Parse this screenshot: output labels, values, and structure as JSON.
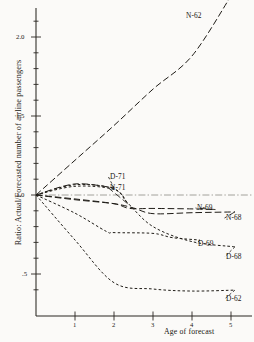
{
  "chart_data": {
    "type": "line",
    "title": "",
    "xlabel": "Age of forecast",
    "ylabel": "Ratio: Actual/Forecasted number of airline passengers",
    "xlim": [
      0,
      5.4
    ],
    "ylim": [
      0.33,
      2.3
    ],
    "xticks": [
      1,
      2,
      3,
      4,
      5
    ],
    "xticklabels": [
      "1",
      "2",
      "3",
      "4",
      "5"
    ],
    "yticks": [
      0.5,
      1.0,
      1.5,
      2.0
    ],
    "yticklabels": [
      ".5",
      "1.0",
      "1.5",
      "2.0"
    ],
    "yminorticks": [
      0.4,
      0.6,
      0.7,
      0.8,
      0.9,
      1.1,
      1.2,
      1.3,
      1.4,
      1.6,
      1.7,
      1.8,
      1.9,
      2.1,
      2.2
    ],
    "grid": false,
    "legend_position": "inline-end-labels",
    "reference_line": {
      "y": 1.0,
      "style": "dash-dot",
      "color": "#8d8b84"
    },
    "series": [
      {
        "name": "N-62",
        "label": "N-62",
        "style": "long-dash",
        "color": "#1f1c17",
        "x": [
          0,
          1,
          2,
          3,
          4,
          5
        ],
        "values": [
          1.0,
          1.22,
          1.44,
          1.67,
          1.88,
          2.26
        ]
      },
      {
        "name": "D-71",
        "label": "D-71",
        "style": "long-dash",
        "color": "#1f1c17",
        "x": [
          0,
          1,
          2
        ],
        "values": [
          1.0,
          1.07,
          1.045
        ]
      },
      {
        "name": "N-71",
        "label": "N-71",
        "style": "short-dash",
        "color": "#1f1c17",
        "x": [
          0,
          1,
          2,
          2.35
        ],
        "values": [
          1.0,
          1.065,
          1.04,
          0.945
        ]
      },
      {
        "name": "N-69",
        "label": "N-69",
        "style": "long-dash",
        "color": "#1f1c17",
        "x": [
          0,
          1,
          2,
          2.4,
          3,
          4,
          4.6
        ],
        "values": [
          1.0,
          0.975,
          0.945,
          0.915,
          0.915,
          0.912,
          0.908
        ]
      },
      {
        "name": "N-68",
        "label": "N-68",
        "style": "long-dash",
        "color": "#1f1c17",
        "x": [
          0,
          1,
          2,
          2.5,
          3,
          4,
          5.1
        ],
        "values": [
          1.0,
          0.97,
          0.945,
          0.918,
          0.882,
          0.888,
          0.893
        ]
      },
      {
        "name": "D-69",
        "label": "D-69",
        "style": "short-dash",
        "color": "#1f1c17",
        "x": [
          0,
          1,
          1.8,
          2,
          3,
          3.5,
          4.2
        ],
        "values": [
          1.0,
          0.885,
          0.77,
          0.762,
          0.757,
          0.73,
          0.715
        ]
      },
      {
        "name": "D-68",
        "label": "D-68",
        "style": "short-dash",
        "color": "#1f1c17",
        "x": [
          0,
          1,
          2,
          2.35,
          3,
          4,
          5.1
        ],
        "values": [
          1.0,
          1.055,
          1.035,
          0.95,
          0.8,
          0.705,
          0.672
        ]
      },
      {
        "name": "D-62",
        "label": "D-62",
        "style": "short-dash",
        "color": "#1f1c17",
        "x": [
          0,
          1,
          2,
          3,
          4,
          5.1
        ],
        "values": [
          1.0,
          0.715,
          0.445,
          0.405,
          0.392,
          0.398
        ]
      }
    ],
    "annotations": [
      {
        "text": "N-62",
        "x_px": 186,
        "y_px": 11,
        "leader": false
      },
      {
        "text": "D-71",
        "x_px": 110,
        "y_px": 172,
        "leader": true
      },
      {
        "text": "N-71",
        "x_px": 110,
        "y_px": 183,
        "leader": true
      },
      {
        "text": "N-69",
        "x_px": 197,
        "y_px": 203,
        "leader": true
      },
      {
        "text": "N-68",
        "x_px": 226,
        "y_px": 213,
        "leader": true
      },
      {
        "text": "D-69",
        "x_px": 198,
        "y_px": 239,
        "leader": true
      },
      {
        "text": "D-68",
        "x_px": 226,
        "y_px": 252,
        "leader": true
      },
      {
        "text": "D-62",
        "x_px": 226,
        "y_px": 294,
        "leader": true
      }
    ]
  }
}
